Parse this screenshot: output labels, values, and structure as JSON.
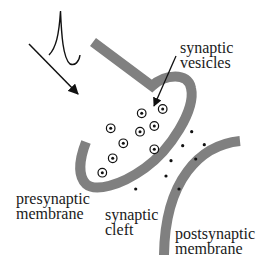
{
  "diagram": {
    "labels": {
      "synaptic_vesicles": {
        "line1": "synaptic",
        "line2": "vesicles"
      },
      "presynaptic_membrane": {
        "line1": "presynaptic",
        "line2": "membrane"
      },
      "synaptic_cleft": {
        "line1": "synaptic",
        "line2": "cleft"
      },
      "postsynaptic_membrane": {
        "line1": "postsynaptic",
        "line2": "membrane"
      }
    },
    "icons": [
      "action-potential-spike",
      "incoming-arrow",
      "vesicle-pointer-arrow"
    ],
    "colors": {
      "membrane": "#808080",
      "ink": "#111111",
      "background": "#ffffff"
    },
    "vesicles": [
      {
        "x": 141.7,
        "y": 113.3
      },
      {
        "x": 162.7,
        "y": 109
      },
      {
        "x": 110.7,
        "y": 128.3
      },
      {
        "x": 140,
        "y": 131.7
      },
      {
        "x": 154.3,
        "y": 126
      },
      {
        "x": 123.3,
        "y": 143.3
      },
      {
        "x": 154.3,
        "y": 149.3
      },
      {
        "x": 112.7,
        "y": 158.3
      },
      {
        "x": 102.3,
        "y": 172.7
      }
    ],
    "neurotransmitters": [
      {
        "x": 191.7,
        "y": 131.7
      },
      {
        "x": 182.7,
        "y": 145.7
      },
      {
        "x": 204.3,
        "y": 144.7
      },
      {
        "x": 171,
        "y": 160.7
      },
      {
        "x": 195.7,
        "y": 159
      },
      {
        "x": 166,
        "y": 176
      },
      {
        "x": 179,
        "y": 189
      },
      {
        "x": 135.7,
        "y": 189
      }
    ]
  }
}
